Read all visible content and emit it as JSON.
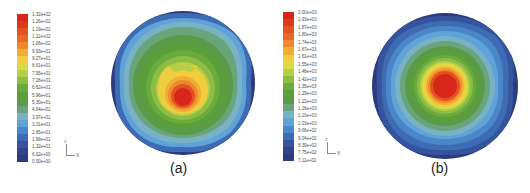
{
  "chart_data": [
    {
      "type": "heatmap",
      "title": "",
      "subplot_label": "(a)",
      "description": "Circular contour plot; maximum at center (red), decreasing radially to blue at rim; yellow region with two small notches above the red core",
      "colorbar": {
        "labels": [
          "1.32e+02",
          "1.26e+02",
          "1.19e+02",
          "1.12e+02",
          "1.06e+02",
          "9.93e+01",
          "9.27e+01",
          "8.61e+01",
          "7.95e+01",
          "7.28e+01",
          "6.62e+01",
          "5.96e+01",
          "5.30e+01",
          "4.64e+01",
          "3.97e+01",
          "3.31e+01",
          "2.65e+01",
          "1.99e+01",
          "1.32e+01",
          "6.62e+00",
          "0.00e+00"
        ],
        "min": 0.0,
        "max": 132.0
      },
      "axis_triad": {
        "x_label": "X",
        "z_label": "Z"
      }
    },
    {
      "type": "heatmap",
      "title": "",
      "subplot_label": "(b)",
      "description": "Circular contour plot; maximum at center (red), concentric rings of yellow, green, light blue, dark blue at rim with slightly lobed outer bands",
      "colorbar": {
        "labels": [
          "2.00e+03",
          "1.93e+03",
          "1.87e+03",
          "1.80e+03",
          "1.74e+03",
          "1.67e+03",
          "1.61e+03",
          "1.55e+03",
          "1.48e+03",
          "1.42e+03",
          "1.35e+03",
          "1.29e+03",
          "1.22e+03",
          "1.16e+03",
          "1.10e+03",
          "1.03e+03",
          "9.66e+02",
          "9.04e+02",
          "8.39e+02",
          "7.75e+02",
          "7.11e+02"
        ],
        "min": 711.0,
        "max": 2000.0
      },
      "axis_triad": {
        "x_label": "X",
        "z_label": "Z"
      }
    }
  ],
  "colormap": [
    "#d7261a",
    "#dd3a1c",
    "#e25222",
    "#e86a26",
    "#ee8a2c",
    "#f2ad36",
    "#f0cd3e",
    "#dcdb45",
    "#b7cf48",
    "#8ebd44",
    "#6aab3e",
    "#5a9f3a",
    "#5b9b48",
    "#69a47a",
    "#78b2c4",
    "#5fa3d8",
    "#4a87c9",
    "#3e6cb4",
    "#36549e",
    "#30438d",
    "#2c3a7f"
  ]
}
